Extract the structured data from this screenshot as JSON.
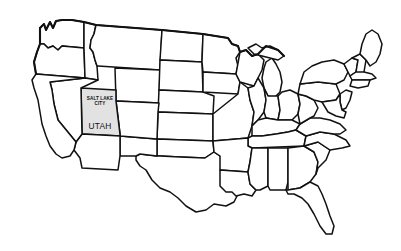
{
  "figure": {
    "kind": "map",
    "background_color": "#ffffff",
    "outline_color": "#111111",
    "state_fill_color": "#ffffff",
    "highlight_fill_color": "#e2e2e2",
    "region": "Contiguous United States"
  },
  "labels": {
    "city_line1": "SALT LAKE",
    "city_line2": "CITY",
    "state": "UTAH"
  },
  "highlighted_state": {
    "name": "UTAH",
    "capital": "SALT LAKE CITY",
    "fill": "#e2e2e2"
  }
}
